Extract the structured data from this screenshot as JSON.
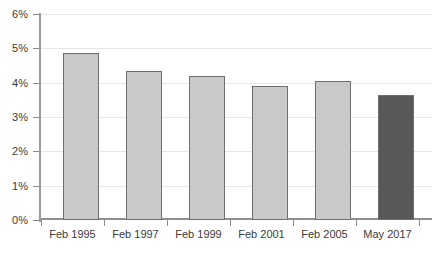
{
  "chart_data": {
    "type": "bar",
    "title": "",
    "subtitle": "",
    "xlabel": "",
    "ylabel": "",
    "categories": [
      "Feb 1995",
      "Feb 1997",
      "Feb 1999",
      "Feb 2001",
      "Feb 2005",
      "May 2017"
    ],
    "values": [
      4.85,
      4.35,
      4.2,
      3.9,
      4.05,
      3.65
    ],
    "value_unit": "%",
    "ylim": [
      0,
      6
    ],
    "ytick_labels": [
      "0%",
      "1%",
      "2%",
      "3%",
      "4%",
      "5%",
      "6%"
    ],
    "ytick_values": [
      0,
      1,
      2,
      3,
      4,
      5,
      6
    ],
    "grid": true,
    "grid_axis": "y",
    "legend": false,
    "legend_position": "none",
    "annotations": [],
    "bar_colors": [
      "#c9c9c9",
      "#c9c9c9",
      "#c9c9c9",
      "#c9c9c9",
      "#c9c9c9",
      "#585858"
    ],
    "bar_edge_color": "#6e6e6e",
    "highlighted_category": "May 2017",
    "gridline_color": "#e6e6e6",
    "axis_color": "#8f8f8f",
    "background_color": "#ffffff",
    "text_color": "#3c3c3c"
  }
}
